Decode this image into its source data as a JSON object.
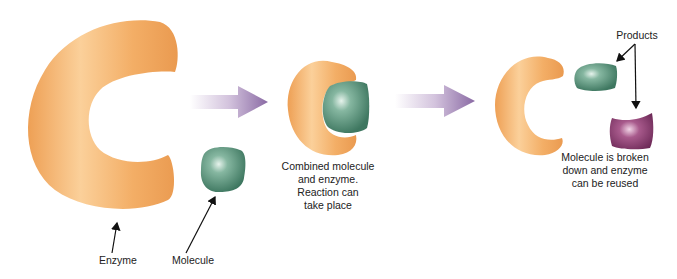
{
  "labels": {
    "enzyme": "Enzyme",
    "molecule": "Molecule",
    "combined": [
      "Combined molecule",
      "and enzyme.",
      "Reaction can",
      "take place"
    ],
    "products": "Products",
    "broken": [
      "Molecule is broken",
      "down and enzyme",
      "can be reused"
    ]
  },
  "colors": {
    "enzyme": "#f2ad64",
    "enzyme_highlight": "#fbd6a4",
    "molecule": "#4e8a72",
    "molecule_highlight": "#c9e3d6",
    "product_purple": "#8a3a6e",
    "arrow_purple": "#8a6aa4"
  }
}
